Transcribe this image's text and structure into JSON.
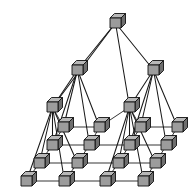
{
  "figure": {
    "title": "Hierarchical pyramid cube network topology",
    "type": "diagram",
    "background_color": "#ffffff",
    "line_color": "#1a1a1a",
    "node_shape": "cube",
    "node_colors": {
      "top_face": "#b8b8b8",
      "front_face": "#9c9c9c",
      "side_face": "#6e6e6e",
      "outline": "#111111"
    },
    "canvas": {
      "width": 193,
      "height": 195
    },
    "cube_size": {
      "front_w": 11,
      "front_h": 10,
      "depth_x": 4.5,
      "depth_y": 4.5
    },
    "level_count": 4,
    "levels": [
      {
        "index": 0,
        "name": "apex",
        "node_count": 1,
        "nodes": [
          {
            "id": "L0-0",
            "x": 110,
            "y": 18
          }
        ]
      },
      {
        "index": 1,
        "name": "tier-2",
        "node_count": 2,
        "nodes": [
          {
            "id": "L1-0",
            "x": 72,
            "y": 65
          },
          {
            "id": "L1-1",
            "x": 148,
            "y": 65
          }
        ]
      },
      {
        "index": 2,
        "name": "tier-3",
        "node_count": 2,
        "nodes": [
          {
            "id": "L2-0",
            "x": 47,
            "y": 102
          },
          {
            "id": "L2-1",
            "x": 124,
            "y": 102
          }
        ]
      },
      {
        "index": 3,
        "name": "mesh-base",
        "node_count": 16,
        "rows": [
          {
            "row": 0,
            "nodes": [
              {
                "id": "M0-0",
                "x": 58,
                "y": 122
              },
              {
                "id": "M0-1",
                "x": 94,
                "y": 122
              },
              {
                "id": "M0-2",
                "x": 135,
                "y": 122
              },
              {
                "id": "M0-3",
                "x": 172,
                "y": 122
              }
            ]
          },
          {
            "row": 1,
            "nodes": [
              {
                "id": "M1-0",
                "x": 47,
                "y": 140
              },
              {
                "id": "M1-1",
                "x": 84,
                "y": 140
              },
              {
                "id": "M1-2",
                "x": 124,
                "y": 140
              },
              {
                "id": "M1-3",
                "x": 161,
                "y": 140
              }
            ]
          },
          {
            "row": 2,
            "nodes": [
              {
                "id": "M2-0",
                "x": 34,
                "y": 158
              },
              {
                "id": "M2-1",
                "x": 72,
                "y": 158
              },
              {
                "id": "M2-2",
                "x": 113,
                "y": 158
              },
              {
                "id": "M2-3",
                "x": 150,
                "y": 158
              }
            ]
          },
          {
            "row": 3,
            "nodes": [
              {
                "id": "M3-0",
                "x": 21,
                "y": 176
              },
              {
                "id": "M3-1",
                "x": 59,
                "y": 176
              },
              {
                "id": "M3-2",
                "x": 100,
                "y": 176
              },
              {
                "id": "M3-3",
                "x": 138,
                "y": 176
              }
            ]
          }
        ]
      }
    ],
    "tree_edges": [
      {
        "from": "L0-0",
        "to": "L1-0"
      },
      {
        "from": "L0-0",
        "to": "L1-1"
      },
      {
        "from": "L0-0",
        "to": "L2-0"
      },
      {
        "from": "L0-0",
        "to": "L2-1"
      },
      {
        "from": "L1-0",
        "to": "L2-0"
      },
      {
        "from": "L1-0",
        "to": "M0-0"
      },
      {
        "from": "L1-0",
        "to": "M0-1"
      },
      {
        "from": "L1-0",
        "to": "M1-0"
      },
      {
        "from": "L1-0",
        "to": "M1-1"
      },
      {
        "from": "L1-1",
        "to": "L2-1"
      },
      {
        "from": "L1-1",
        "to": "M0-2"
      },
      {
        "from": "L1-1",
        "to": "M0-3"
      },
      {
        "from": "L1-1",
        "to": "M1-2"
      },
      {
        "from": "L1-1",
        "to": "M1-3"
      },
      {
        "from": "L2-0",
        "to": "M1-0"
      },
      {
        "from": "L2-0",
        "to": "M2-0"
      },
      {
        "from": "L2-0",
        "to": "M2-1"
      },
      {
        "from": "L2-0",
        "to": "M3-0"
      },
      {
        "from": "L2-0",
        "to": "M3-1"
      },
      {
        "from": "L2-1",
        "to": "M1-2"
      },
      {
        "from": "L2-1",
        "to": "M2-2"
      },
      {
        "from": "L2-1",
        "to": "M2-3"
      },
      {
        "from": "L2-1",
        "to": "M3-2"
      },
      {
        "from": "L2-1",
        "to": "M3-3"
      }
    ],
    "mesh_row_edges": [
      [
        "L2-0",
        "M0-0",
        "M0-1",
        "L2-1",
        "M0-2",
        "M0-3"
      ],
      [
        "M1-0",
        "M1-1",
        "M1-2",
        "M1-3"
      ],
      [
        "M2-0",
        "M2-1",
        "M2-2",
        "M2-3"
      ],
      [
        "M3-0",
        "M3-1",
        "M3-2",
        "M3-3"
      ]
    ],
    "mesh_col_edges": [
      [
        "M0-0",
        "M1-0",
        "M2-0",
        "M3-0"
      ],
      [
        "M0-1",
        "M1-1",
        "M2-1",
        "M3-1"
      ],
      [
        "M0-2",
        "M1-2",
        "M2-2",
        "M3-2"
      ],
      [
        "M0-3",
        "M1-3",
        "M2-3",
        "M3-3"
      ]
    ]
  }
}
